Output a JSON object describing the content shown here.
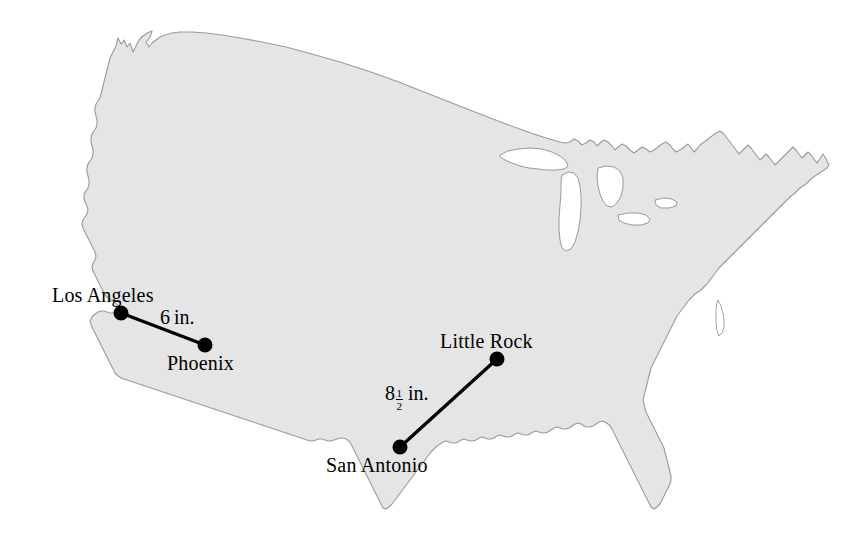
{
  "figure": {
    "type": "map-diagram",
    "region": "United States",
    "background_color": "#ffffff",
    "land_fill_color": "#e5e5e5",
    "land_outline_color": "#9a9a9a",
    "lake_fill_color": "#ffffff",
    "marker_color": "#000000",
    "line_color": "#000000"
  },
  "cities": [
    {
      "name": "Los Angeles",
      "label_x": 52,
      "label_y": 284,
      "dot_x": 121,
      "dot_y": 313
    },
    {
      "name": "Phoenix",
      "label_x": 167,
      "label_y": 352,
      "dot_x": 205,
      "dot_y": 345
    },
    {
      "name": "Little Rock",
      "label_x": 440,
      "label_y": 330,
      "dot_x": 497,
      "dot_y": 359
    },
    {
      "name": "San Antonio",
      "label_x": 326,
      "label_y": 454,
      "dot_x": 400,
      "dot_y": 447
    }
  ],
  "segments": [
    {
      "id": "la-phoenix",
      "from": "Los Angeles",
      "to": "Phoenix",
      "x1": 121,
      "y1": 313,
      "x2": 205,
      "y2": 345,
      "distance_text": "6 in.",
      "whole": "6",
      "numerator": "",
      "denominator": "",
      "unit": "in.",
      "label_x": 160,
      "label_y": 306
    },
    {
      "id": "sanantonio-littlerock",
      "from": "San Antonio",
      "to": "Little Rock",
      "x1": 400,
      "y1": 447,
      "x2": 497,
      "y2": 359,
      "distance_text": "8 1/2 in.",
      "whole": "8",
      "numerator": "1",
      "denominator": "2",
      "unit": "in.",
      "label_x": 385,
      "label_y": 382
    }
  ],
  "artifact": {
    "text": "bleed-through scan artifact"
  }
}
